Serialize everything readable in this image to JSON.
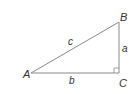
{
  "diagram": {
    "type": "right-triangle",
    "line_color": "#8a8a8a",
    "text_color": "#333333",
    "vertices": [
      {
        "name": "A",
        "x": 31,
        "y": 73,
        "label_x": 23,
        "label_y": 78
      },
      {
        "name": "B",
        "x": 119,
        "y": 22,
        "label_x": 120,
        "label_y": 21
      },
      {
        "name": "C",
        "x": 119,
        "y": 73,
        "label_x": 119,
        "label_y": 87
      }
    ],
    "sides": [
      {
        "name": "c",
        "label_x": 68,
        "label_y": 45
      },
      {
        "name": "a",
        "label_x": 122,
        "label_y": 52
      },
      {
        "name": "b",
        "label_x": 69,
        "label_y": 84
      }
    ],
    "right_angle_at": "C"
  }
}
